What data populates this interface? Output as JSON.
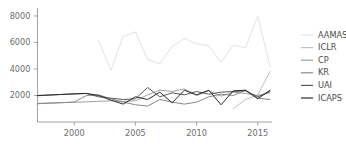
{
  "chart_data": {
    "type": "line",
    "title": "",
    "xlabel": "",
    "ylabel": "",
    "xlim": [
      1997,
      2016
    ],
    "ylim": [
      0,
      8600
    ],
    "grid": false,
    "legend_position": "right",
    "xticks": [
      2000,
      2005,
      2010,
      2015
    ],
    "xtick_labels": [
      "2000",
      "2005",
      "2010",
      "2015"
    ],
    "yticks": [
      2000,
      4000,
      6000,
      8000
    ],
    "ytick_labels": [
      "2000",
      "4000",
      "6000",
      "8000"
    ],
    "series": [
      {
        "name": "AAMAS",
        "color": "#e2e2e2",
        "x": [
          2002,
          2003,
          2004,
          2005,
          2006,
          2007,
          2008,
          2009,
          2010,
          2011,
          2012,
          2013,
          2014,
          2015,
          2016
        ],
        "values": [
          6100,
          3900,
          6450,
          6800,
          4700,
          4400,
          5700,
          6300,
          5900,
          5750,
          4500,
          5800,
          5600,
          8000,
          4200
        ]
      },
      {
        "name": "ICLR",
        "color": "#c0c0c0",
        "x": [
          2013,
          2014,
          2015,
          2016
        ],
        "values": [
          1000,
          1700,
          2050,
          3800
        ]
      },
      {
        "name": "CP",
        "color": "#a0a0a0",
        "x": [
          1997,
          1998,
          1999,
          2000,
          2001,
          2002,
          2003,
          2004,
          2005,
          2006,
          2007,
          2008,
          2009,
          2010,
          2011,
          2012,
          2013,
          2014,
          2015,
          2016
        ],
        "values": [
          1400,
          1430,
          1460,
          1490,
          1520,
          1560,
          1600,
          1560,
          1600,
          2050,
          2400,
          2300,
          2500,
          2000,
          2350,
          1950,
          2250,
          2150,
          2000,
          2200
        ]
      },
      {
        "name": "KR",
        "color": "#888888",
        "x": [
          1997,
          1998,
          1999,
          2000,
          2001,
          2002,
          2003,
          2004,
          2005,
          2006,
          2007,
          2008,
          2009,
          2010,
          2011,
          2012,
          2013,
          2014,
          2015,
          2016
        ],
        "values": [
          1380,
          1420,
          1460,
          1500,
          2000,
          2050,
          1750,
          1500,
          1300,
          1200,
          1700,
          1500,
          1350,
          1500,
          1900,
          2100,
          2000,
          2400,
          1800,
          1700
        ]
      },
      {
        "name": "UAI",
        "color": "#5a5a5a",
        "x": [
          1997,
          1998,
          1999,
          2000,
          2001,
          2002,
          2003,
          2004,
          2005,
          2006,
          2007,
          2008,
          2009,
          2010,
          2011,
          2012,
          2013,
          2014,
          2015,
          2016
        ],
        "values": [
          1980,
          2030,
          2080,
          2120,
          2150,
          1900,
          1800,
          1700,
          1750,
          2600,
          1900,
          2200,
          2050,
          2300,
          2100,
          2250,
          2300,
          2350,
          1900,
          2300
        ]
      },
      {
        "name": "ICAPS",
        "color": "#2b2b2b",
        "x": [
          1997,
          1998,
          1999,
          2000,
          2001,
          2002,
          2003,
          2004,
          2005,
          2006,
          2007,
          2008,
          2009,
          2010,
          2011,
          2012,
          2013,
          2014,
          2015,
          2016
        ],
        "values": [
          2000,
          2040,
          2080,
          2120,
          2160,
          2000,
          1650,
          1350,
          1900,
          1700,
          2250,
          1450,
          2400,
          2050,
          2400,
          1300,
          2350,
          2400,
          1750,
          2400
        ]
      }
    ]
  },
  "legend": {
    "entries": [
      {
        "label": "AAMAS"
      },
      {
        "label": "ICLR"
      },
      {
        "label": "CP"
      },
      {
        "label": "KR"
      },
      {
        "label": "UAI"
      },
      {
        "label": "ICAPS"
      }
    ]
  }
}
